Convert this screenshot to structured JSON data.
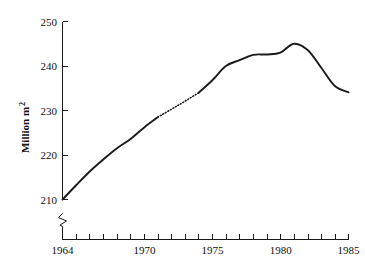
{
  "chart_data": {
    "type": "line",
    "title": "",
    "xlabel": "",
    "ylabel": "Million m",
    "ylabel_superscript": "2",
    "ylabel_full": "Million m2",
    "xlim": [
      1964,
      1985
    ],
    "ylim": [
      210,
      250
    ],
    "y_axis_broken": true,
    "y_break_note": "axis break below 210",
    "grid": false,
    "legend": null,
    "x_ticks_all": [
      1964,
      1965,
      1966,
      1967,
      1968,
      1969,
      1970,
      1971,
      1972,
      1973,
      1974,
      1975,
      1976,
      1977,
      1978,
      1979,
      1980,
      1981,
      1982,
      1983,
      1984,
      1985
    ],
    "x_tick_labels": [
      "1964",
      "1970",
      "1975",
      "1980",
      "1985"
    ],
    "x_tick_label_values": [
      1964,
      1970,
      1975,
      1980,
      1985
    ],
    "y_ticks": [
      210,
      220,
      230,
      240,
      250
    ],
    "y_tick_labels": [
      "210",
      "220",
      "230",
      "240",
      "250"
    ],
    "x": [
      1964,
      1965,
      1966,
      1967,
      1968,
      1969,
      1970,
      1971,
      1972,
      1973,
      1974,
      1975,
      1976,
      1977,
      1978,
      1979,
      1980,
      1981,
      1982,
      1983,
      1984,
      1985
    ],
    "values": [
      210.0,
      213.2,
      216.3,
      219.0,
      221.5,
      223.6,
      226.2,
      228.5,
      230.3,
      232.1,
      234.0,
      236.8,
      240.0,
      241.3,
      242.5,
      242.6,
      243.0,
      245.0,
      243.6,
      239.6,
      235.5,
      234.1
    ],
    "segments": [
      {
        "name": "observed-early",
        "style": "solid",
        "from": 1964,
        "to": 1971
      },
      {
        "name": "interpolated",
        "style": "dotted",
        "from": 1971,
        "to": 1974
      },
      {
        "name": "observed-late",
        "style": "solid",
        "from": 1974,
        "to": 1985
      }
    ],
    "annotations": [
      {
        "name": "peak",
        "x": 1981,
        "y": 245.0
      },
      {
        "name": "start",
        "x": 1964,
        "y": 210.0
      },
      {
        "name": "end",
        "x": 1985,
        "y": 234.1
      }
    ],
    "colors": {
      "series": "#1a1a1a",
      "axis": "#1a1a1a",
      "background": "#ffffff"
    }
  }
}
